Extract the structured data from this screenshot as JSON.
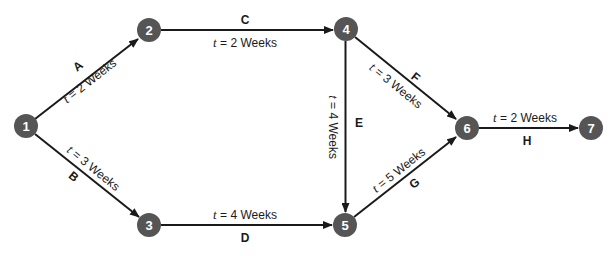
{
  "diagram": {
    "type": "activity-on-arrow network",
    "colors": {
      "node_fill": "#555555",
      "node_text": "#ffffff",
      "edge": "#1a1a1a",
      "background": "#ffffff"
    },
    "nodes": [
      {
        "id": "1",
        "label": "1",
        "x": 26,
        "y": 126
      },
      {
        "id": "2",
        "label": "2",
        "x": 149,
        "y": 30
      },
      {
        "id": "3",
        "label": "3",
        "x": 149,
        "y": 225
      },
      {
        "id": "4",
        "label": "4",
        "x": 346,
        "y": 29
      },
      {
        "id": "5",
        "label": "5",
        "x": 345,
        "y": 225
      },
      {
        "id": "6",
        "label": "6",
        "x": 467,
        "y": 128
      },
      {
        "id": "7",
        "label": "7",
        "x": 591,
        "y": 128
      }
    ],
    "edges": [
      {
        "activity": "A",
        "from": "1",
        "to": "2",
        "t_var": "t",
        "time_text": " = 2 Weeks",
        "duration_weeks": 2
      },
      {
        "activity": "B",
        "from": "1",
        "to": "3",
        "t_var": "t",
        "time_text": " = 3 Weeks",
        "duration_weeks": 3
      },
      {
        "activity": "C",
        "from": "2",
        "to": "4",
        "t_var": "t",
        "time_text": " = 2 Weeks",
        "duration_weeks": 2
      },
      {
        "activity": "D",
        "from": "3",
        "to": "5",
        "t_var": "t",
        "time_text": " = 4 Weeks",
        "duration_weeks": 4
      },
      {
        "activity": "E",
        "from": "4",
        "to": "5",
        "t_var": "t",
        "time_text": " = 4 Weeks",
        "duration_weeks": 4
      },
      {
        "activity": "F",
        "from": "4",
        "to": "6",
        "t_var": "t",
        "time_text": " = 3 Weeks",
        "duration_weeks": 3
      },
      {
        "activity": "G",
        "from": "5",
        "to": "6",
        "t_var": "t",
        "time_text": " = 5 Weeks",
        "duration_weeks": 5
      },
      {
        "activity": "H",
        "from": "6",
        "to": "7",
        "t_var": "t",
        "time_text": " = 2 Weeks",
        "duration_weeks": 2
      }
    ]
  }
}
